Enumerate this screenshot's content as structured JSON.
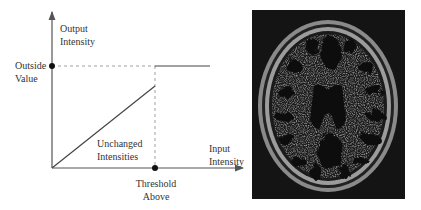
{
  "diagram": {
    "y_axis_label": [
      "Output",
      "Intensity"
    ],
    "x_axis_label": [
      "Input",
      "Intensity"
    ],
    "outside_value_label": [
      "Outside",
      "Value"
    ],
    "threshold_label": [
      "Threshold",
      "Above"
    ],
    "region_label": [
      "Unchanged",
      "Intensities"
    ],
    "colors": {
      "line": "#444444",
      "dashed": "#888888",
      "dot": "#111111"
    }
  },
  "image": {
    "caption": "axial brain MRI slice thresholded above",
    "colors": {
      "background": "#141414",
      "tissue": "#a8a8a8",
      "csf": "#0d0d0d"
    }
  }
}
